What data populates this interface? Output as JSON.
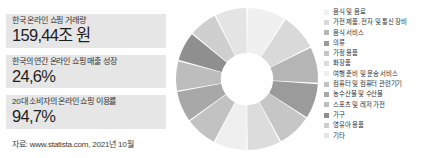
{
  "stats": {
    "cards": [
      {
        "label": "한국 온라인 쇼핑 거래량",
        "value": "159,44조 원"
      },
      {
        "label": "한국의 연간 온라인 쇼핑 매출 성장",
        "value": "24,6%"
      },
      {
        "label": "20대 소비자의 온라인 쇼핑 이용률",
        "value": "94,7%"
      }
    ],
    "source": "자료: www.statista.com, 2021년 10월"
  },
  "chart_data": {
    "type": "pie",
    "title": "",
    "subtitle": "",
    "xlabel": "",
    "ylabel": "",
    "grid": false,
    "legend_position": "right",
    "donut": true,
    "inner_radius_ratio": 0.37,
    "start_angle": 0,
    "categories": [
      "음식 및 음료",
      "가전 제품, 전자 및 통신 장비",
      "음식 서비스",
      "의류",
      "가정 용품",
      "화장품",
      "여행 준비 및 운송 서비스",
      "컴퓨터 및 컴퓨터 관련기기",
      "농수산물 및 수산물",
      "스포츠 및 레저 가전",
      "가구",
      "영유아 용품",
      "기타"
    ],
    "values": [
      9.0,
      8.6,
      8.4,
      8.2,
      8.0,
      7.8,
      7.6,
      7.4,
      7.2,
      7.0,
      6.8,
      6.6,
      7.4
    ],
    "colors": [
      "#f0f0f0",
      "#d9d9d9",
      "#b5b5b5",
      "#9b9b9b",
      "#c6c6c6",
      "#dcdcdc",
      "#efefef",
      "#c2c2c2",
      "#a8a8a8",
      "#bdbdbd",
      "#8f8f8f",
      "#cfcfcf",
      "#e4e4e4"
    ]
  }
}
